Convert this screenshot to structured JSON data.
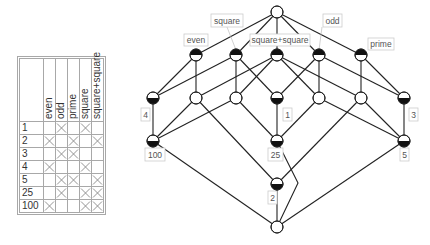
{
  "context_table": {
    "attributes": [
      "even",
      "odd",
      "prime",
      "square",
      "square+square"
    ],
    "objects": [
      {
        "name": "1",
        "has": [
          false,
          true,
          false,
          true,
          false
        ]
      },
      {
        "name": "2",
        "has": [
          true,
          false,
          true,
          false,
          true
        ]
      },
      {
        "name": "3",
        "has": [
          false,
          true,
          true,
          false,
          false
        ]
      },
      {
        "name": "4",
        "has": [
          true,
          false,
          false,
          true,
          false
        ]
      },
      {
        "name": "5",
        "has": [
          false,
          true,
          true,
          false,
          true
        ]
      },
      {
        "name": "25",
        "has": [
          false,
          true,
          false,
          true,
          true
        ]
      },
      {
        "name": "100",
        "has": [
          true,
          false,
          false,
          true,
          true
        ]
      }
    ]
  },
  "lattice": {
    "colors": {
      "line": "#222222",
      "node_fill": "#ffffff",
      "node_dark": "#111111",
      "label_border": "#cccccc",
      "label_text": "#555555"
    },
    "nodes": [
      {
        "id": "top",
        "x": 277,
        "y": 12,
        "top_half": false,
        "bottom_half": false
      },
      {
        "id": "even",
        "x": 196,
        "y": 55,
        "top_half": true,
        "bottom_half": false
      },
      {
        "id": "square",
        "x": 236,
        "y": 55,
        "top_half": true,
        "bottom_half": false
      },
      {
        "id": "sqsq",
        "x": 277,
        "y": 55,
        "top_half": true,
        "bottom_half": false
      },
      {
        "id": "odd",
        "x": 319,
        "y": 55,
        "top_half": true,
        "bottom_half": false
      },
      {
        "id": "prime",
        "x": 361,
        "y": 55,
        "top_half": true,
        "bottom_half": false
      },
      {
        "id": "o4",
        "x": 153,
        "y": 98,
        "top_half": false,
        "bottom_half": true
      },
      {
        "id": "even_ss",
        "x": 196,
        "y": 98,
        "top_half": false,
        "bottom_half": false
      },
      {
        "id": "sq_ss",
        "x": 236,
        "y": 98,
        "top_half": false,
        "bottom_half": false
      },
      {
        "id": "o1",
        "x": 277,
        "y": 98,
        "top_half": false,
        "bottom_half": true
      },
      {
        "id": "odd_ss",
        "x": 319,
        "y": 98,
        "top_half": false,
        "bottom_half": false
      },
      {
        "id": "prime_ss",
        "x": 361,
        "y": 98,
        "top_half": false,
        "bottom_half": false
      },
      {
        "id": "o3",
        "x": 404,
        "y": 98,
        "top_half": false,
        "bottom_half": true
      },
      {
        "id": "o100",
        "x": 153,
        "y": 141,
        "top_half": false,
        "bottom_half": true
      },
      {
        "id": "o25",
        "x": 277,
        "y": 141,
        "top_half": false,
        "bottom_half": true
      },
      {
        "id": "o5",
        "x": 404,
        "y": 141,
        "top_half": false,
        "bottom_half": true
      },
      {
        "id": "o2",
        "x": 277,
        "y": 184,
        "top_half": false,
        "bottom_half": true
      },
      {
        "id": "bottom",
        "x": 277,
        "y": 227,
        "top_half": false,
        "bottom_half": false
      }
    ],
    "edges": [
      [
        "top",
        "even"
      ],
      [
        "top",
        "square"
      ],
      [
        "top",
        "sqsq"
      ],
      [
        "top",
        "odd"
      ],
      [
        "top",
        "prime"
      ],
      [
        "even",
        "o4"
      ],
      [
        "even",
        "even_ss"
      ],
      [
        "square",
        "o4"
      ],
      [
        "square",
        "sq_ss"
      ],
      [
        "square",
        "o1"
      ],
      [
        "sqsq",
        "even_ss"
      ],
      [
        "sqsq",
        "sq_ss"
      ],
      [
        "sqsq",
        "odd_ss"
      ],
      [
        "sqsq",
        "prime_ss"
      ],
      [
        "odd",
        "o1"
      ],
      [
        "odd",
        "odd_ss"
      ],
      [
        "odd",
        "o3"
      ],
      [
        "prime",
        "prime_ss"
      ],
      [
        "prime",
        "o3"
      ],
      [
        "o4",
        "o100"
      ],
      [
        "even_ss",
        "o100"
      ],
      [
        "even_ss",
        "o2"
      ],
      [
        "sq_ss",
        "o100"
      ],
      [
        "sq_ss",
        "o25"
      ],
      [
        "o1",
        "o25"
      ],
      [
        "odd_ss",
        "o25"
      ],
      [
        "odd_ss",
        "o5"
      ],
      [
        "prime_ss",
        "o5"
      ],
      [
        "prime_ss",
        "o2"
      ],
      [
        "o3",
        "o5"
      ],
      [
        "o100",
        "bottom"
      ],
      [
        "o5",
        "bottom"
      ],
      [
        "o2",
        "bottom"
      ]
    ],
    "polyline_edges": [
      {
        "from": "o25",
        "to": "bottom",
        "points": [
          [
            277,
            141
          ],
          [
            298,
            183
          ],
          [
            277,
            227
          ]
        ]
      }
    ],
    "attribute_labels": [
      {
        "text": "even",
        "x": 184,
        "y": 34,
        "w": 24,
        "h": 12,
        "leader": null
      },
      {
        "text": "square",
        "x": 211,
        "y": 14,
        "w": 32,
        "h": 13,
        "leader": [
          227,
          27,
          236,
          50
        ]
      },
      {
        "text": "square+square",
        "x": 250,
        "y": 34,
        "w": 60,
        "h": 12,
        "leader": null
      },
      {
        "text": "odd",
        "x": 323,
        "y": 14,
        "w": 19,
        "h": 13,
        "leader": [
          322,
          27,
          319,
          50
        ]
      },
      {
        "text": "prime",
        "x": 368,
        "y": 38,
        "w": 26,
        "h": 12,
        "leader": null
      }
    ],
    "object_labels": [
      {
        "text": "4",
        "x": 141,
        "y": 108,
        "w": 9,
        "h": 13
      },
      {
        "text": "1",
        "x": 283,
        "y": 108,
        "w": 9,
        "h": 13
      },
      {
        "text": "3",
        "x": 409,
        "y": 108,
        "w": 9,
        "h": 13
      },
      {
        "text": "100",
        "x": 145,
        "y": 148,
        "w": 20,
        "h": 13
      },
      {
        "text": "25",
        "x": 268,
        "y": 148,
        "w": 15,
        "h": 13
      },
      {
        "text": "5",
        "x": 400,
        "y": 148,
        "w": 9,
        "h": 13
      },
      {
        "text": "2",
        "x": 268,
        "y": 191,
        "w": 9,
        "h": 13
      }
    ]
  }
}
